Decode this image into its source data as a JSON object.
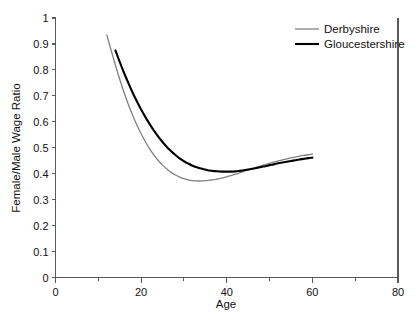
{
  "chart_data": {
    "type": "line",
    "title": "",
    "xlabel": "Age",
    "ylabel": "Female/Male Wage Ratio",
    "xlim": [
      0,
      80
    ],
    "ylim": [
      0,
      1
    ],
    "grid": false,
    "legend_position": "top-right-inside",
    "x_ticks": [
      0,
      20,
      40,
      60,
      80
    ],
    "x_tick_labels": [
      "0",
      "20",
      "40",
      "60",
      "80"
    ],
    "x_minor_ticks": [
      10,
      30,
      50,
      70
    ],
    "y_ticks": [
      0,
      0.1,
      0.2,
      0.3,
      0.4,
      0.5,
      0.6,
      0.7,
      0.8,
      0.9,
      1
    ],
    "y_tick_labels": [
      "0",
      "0.1",
      "0.2",
      "0.3",
      "0.4",
      "0.5",
      "0.6",
      "0.7",
      "0.8",
      "0.9",
      "1"
    ],
    "series": [
      {
        "name": "Derbyshire",
        "color": "#808080",
        "width": 1.3,
        "x": [
          12,
          13,
          14,
          15,
          16,
          17,
          18,
          19,
          20,
          21,
          22,
          23,
          24,
          25,
          26,
          27,
          28,
          29,
          30,
          31,
          32,
          33,
          34,
          35,
          36,
          37,
          38,
          39,
          40,
          41,
          42,
          43,
          44,
          45,
          46,
          47,
          48,
          49,
          50,
          51,
          52,
          53,
          54,
          55,
          56,
          57,
          58,
          59,
          60
        ],
        "values": [
          0.935,
          0.875,
          0.818,
          0.764,
          0.714,
          0.668,
          0.626,
          0.588,
          0.554,
          0.523,
          0.496,
          0.472,
          0.451,
          0.433,
          0.418,
          0.405,
          0.395,
          0.387,
          0.381,
          0.376,
          0.373,
          0.372,
          0.372,
          0.373,
          0.375,
          0.377,
          0.38,
          0.384,
          0.388,
          0.393,
          0.398,
          0.403,
          0.409,
          0.414,
          0.42,
          0.425,
          0.43,
          0.435,
          0.44,
          0.445,
          0.449,
          0.453,
          0.457,
          0.461,
          0.464,
          0.468,
          0.471,
          0.473,
          0.476
        ]
      },
      {
        "name": "Gloucestershire",
        "color": "#000000",
        "width": 2.1,
        "x": [
          14,
          15,
          16,
          17,
          18,
          19,
          20,
          21,
          22,
          23,
          24,
          25,
          26,
          27,
          28,
          29,
          30,
          31,
          32,
          33,
          34,
          35,
          36,
          37,
          38,
          39,
          40,
          41,
          42,
          43,
          44,
          45,
          46,
          47,
          48,
          49,
          50,
          51,
          52,
          53,
          54,
          55,
          56,
          57,
          58,
          59,
          60
        ],
        "values": [
          0.875,
          0.831,
          0.789,
          0.75,
          0.713,
          0.679,
          0.647,
          0.618,
          0.591,
          0.566,
          0.543,
          0.522,
          0.503,
          0.487,
          0.472,
          0.459,
          0.448,
          0.439,
          0.431,
          0.425,
          0.42,
          0.416,
          0.412,
          0.41,
          0.409,
          0.408,
          0.408,
          0.408,
          0.409,
          0.411,
          0.413,
          0.416,
          0.419,
          0.422,
          0.426,
          0.429,
          0.433,
          0.436,
          0.44,
          0.443,
          0.446,
          0.449,
          0.452,
          0.455,
          0.457,
          0.46,
          0.462
        ]
      }
    ],
    "legend": [
      {
        "label": "Derbyshire",
        "color": "#808080"
      },
      {
        "label": "Gloucestershire",
        "color": "#000000"
      }
    ]
  },
  "axes": {
    "x_title": "Age",
    "y_title": "Female/Male Wage Ratio"
  },
  "legend": {
    "items": [
      {
        "label": "Derbyshire"
      },
      {
        "label": "Gloucestershire"
      }
    ]
  }
}
